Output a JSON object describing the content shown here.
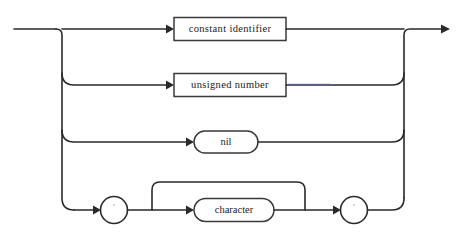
{
  "diagram": {
    "kind": "syntax-railroad-diagram",
    "title": "constant",
    "background_color": "#ffffff",
    "line_color": "#2a2a2a",
    "tint_color": "#5b5fa8",
    "entry": {
      "name": "entry-rail",
      "direction": "right"
    },
    "exit": {
      "name": "exit-rail",
      "direction": "right",
      "arrow": true
    },
    "alternatives": [
      {
        "index": 1,
        "shape": "rectangle",
        "kind": "nonterminal",
        "label": "constant identifier",
        "y": 29
      },
      {
        "index": 2,
        "shape": "rectangle",
        "kind": "nonterminal",
        "label": "unsigned number",
        "y": 85
      },
      {
        "index": 3,
        "shape": "stadium",
        "kind": "terminal",
        "label": "nil",
        "y": 142
      },
      {
        "index": 4,
        "shape": "sequence",
        "kind": "quoted-character-string",
        "y": 210,
        "items": [
          {
            "shape": "circle",
            "kind": "terminal",
            "label": "'",
            "name": "open-quote"
          },
          {
            "shape": "stadium",
            "kind": "nonterminal",
            "label": "character",
            "name": "character",
            "repeat": true
          },
          {
            "shape": "circle",
            "kind": "terminal",
            "label": "'",
            "name": "close-quote"
          }
        ]
      }
    ]
  }
}
